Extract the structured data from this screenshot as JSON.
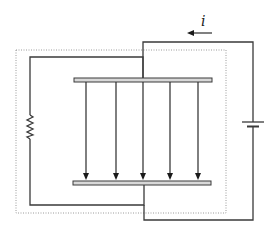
{
  "diagram": {
    "current_label": "i",
    "current_direction": "left",
    "components": [
      {
        "type": "capacitor-plate",
        "position": "top"
      },
      {
        "type": "capacitor-plate",
        "position": "bottom"
      },
      {
        "type": "resistor",
        "position": "left"
      },
      {
        "type": "battery",
        "position": "right"
      },
      {
        "type": "dotted-boundary",
        "description": "enclosing region around capacitor and resistor loop"
      }
    ],
    "field_lines": {
      "count": 5,
      "direction": "down"
    },
    "colors": {
      "wire": "#3a3a3a",
      "plate_fill": "#d8d8d8",
      "dotted_boundary": "#9a9a9a"
    }
  }
}
